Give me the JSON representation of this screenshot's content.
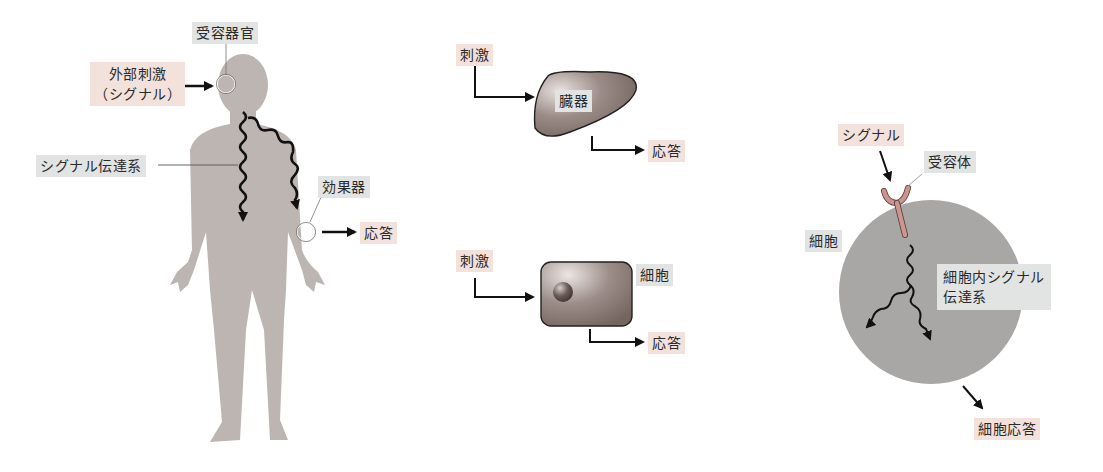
{
  "panels": {
    "organism": {
      "receptor_organ_label": "受容器官",
      "stimulus_label_line1": "外部刺激",
      "stimulus_label_line2": "（シグナル）",
      "signal_pathway_label": "シグナル伝達系",
      "effector_label": "効果器",
      "response_label": "応答"
    },
    "organ": {
      "stimulus_label": "刺激",
      "organ_label": "臓器",
      "response_label": "応答"
    },
    "cell": {
      "stimulus_label": "刺激",
      "cell_label": "細胞",
      "response_label": "応答"
    },
    "cellular_signaling": {
      "signal_label": "シグナル",
      "receptor_label": "受容体",
      "cell_label": "細胞",
      "intracellular_label_line1": "細胞内シグナル",
      "intracellular_label_line2": "伝達系",
      "cell_response_label": "細胞応答"
    }
  },
  "colors": {
    "stimulus_box": "#f3e2dc",
    "structure_box": "#e2e4e3",
    "body_silhouette": "#bdb5b1",
    "organ_fill": "#8a7a76",
    "cell_circle": "#a9a7a5",
    "receptor": "#c99690"
  }
}
